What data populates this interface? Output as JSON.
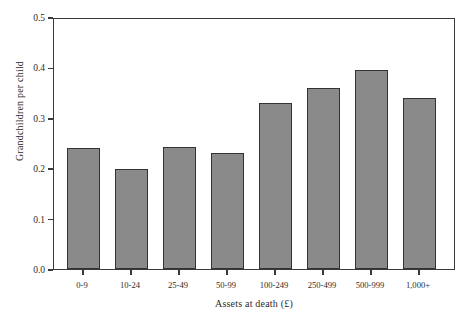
{
  "chart_data": {
    "type": "bar",
    "title": "",
    "subtitle": "",
    "xlabel": "Assets at death (£)",
    "ylabel": "Grandchildren per child",
    "categories": [
      "0-9",
      "10-24",
      "25-49",
      "50-99",
      "100-249",
      "250-499",
      "500-999",
      "1,000+"
    ],
    "values": [
      0.243,
      0.202,
      0.245,
      0.234,
      0.333,
      0.363,
      0.399,
      0.344
    ],
    "series": [
      {
        "name": "Grandchildren per child",
        "values": [
          0.243,
          0.202,
          0.245,
          0.234,
          0.333,
          0.363,
          0.399,
          0.344
        ]
      }
    ],
    "ylim": [
      0.0,
      0.5
    ],
    "ytick_labels": [
      "0.0",
      "0.1",
      "0.2",
      "0.3",
      "0.4",
      "0.5"
    ],
    "ytick_values": [
      0.0,
      0.1,
      0.2,
      0.3,
      0.4,
      0.5
    ],
    "grid": false,
    "legend": false,
    "legend_position": "none",
    "bar_fill_color": "#8a8a8a",
    "bar_edge_color": "#333333",
    "axis_color": "#3a3a3a",
    "background_color": "#ffffff"
  }
}
